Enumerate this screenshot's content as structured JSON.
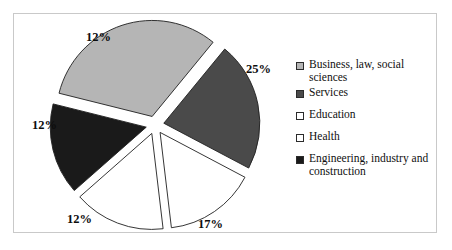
{
  "chart_data": {
    "type": "pie",
    "title": "",
    "subtitle": "",
    "xlabel": "",
    "ylabel": "",
    "exploded": true,
    "legend_position": "right",
    "grid": false,
    "categories": [
      "Business, law, social sciences",
      "Services",
      "Education",
      "Health",
      "Engineering, industry and construction"
    ],
    "values": [
      25,
      17,
      12,
      12,
      12
    ],
    "labels": [
      "25%",
      "17%",
      "12%",
      "12%",
      "12%"
    ],
    "colors": [
      "#b5b5b5",
      "#4a4a4a",
      "#ffffff",
      "#ffffff",
      "#1a1a1a"
    ],
    "slice_outline_color": "#1f1f1f",
    "total_shown": 78
  },
  "legend": {
    "items": [
      {
        "label": "Business, law, social sciences",
        "color": "#b5b5b5"
      },
      {
        "label": "Services",
        "color": "#4a4a4a"
      },
      {
        "label": "Education",
        "color": "#ffffff"
      },
      {
        "label": "Health",
        "color": "#ffffff"
      },
      {
        "label": "Engineering, industry and construction",
        "color": "#1a1a1a"
      }
    ]
  },
  "frame": {
    "border_color": "#c9c9c9",
    "background": "#ffffff"
  }
}
